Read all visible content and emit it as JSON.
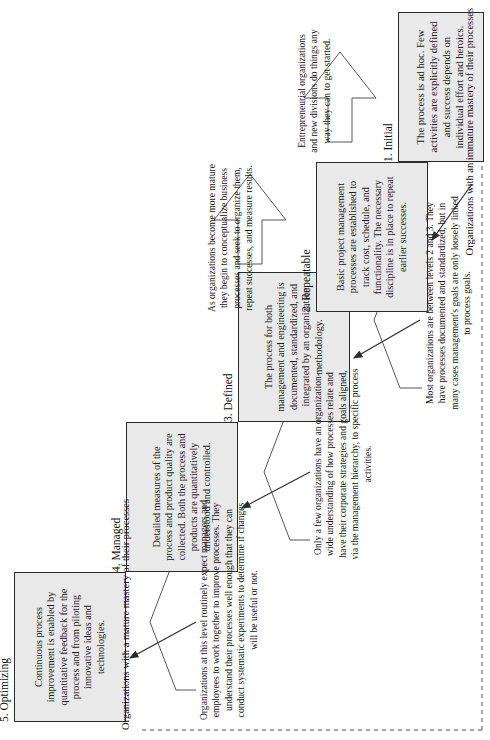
{
  "figure": {
    "type": "cmmi-maturity-staircase",
    "orientation": "rotated-90-ccw",
    "edge_labels": {
      "top": "Organizations with a mature mastery of their processes",
      "bottom": "Organizations with an immature mastery of their processes"
    },
    "colors": {
      "box_fill": "#e9e9e9",
      "box_border": "#2b2b2b",
      "text": "#111111",
      "arrow": "#2b2b2b"
    }
  },
  "levels": [
    {
      "id": "level5",
      "label": "5. Optimizing",
      "body": "Continuous process improvement is enabled by quantitative feedback for the process and from piloting innovative ideas and technologies."
    },
    {
      "id": "level4",
      "label": "4. Managed",
      "body": "Detailed measures of the process and product quality are collected. Both the process and products are quantitatively understood and controlled."
    },
    {
      "id": "level3",
      "label": "3. Defined",
      "body": "The process for both management and engineering is documented, standardized, and integrated by an organization methodology."
    },
    {
      "id": "level2",
      "label": "2. Repeatable",
      "body": "Basic project management processes are established to track cost, schedule, and functionality. The necessary discipline is in place to repeat earlier successes."
    },
    {
      "id": "level1",
      "label": "1. Initial",
      "body": "The process is ad hoc. Few activities are explicitly defined and success depends on individual effort and heroics."
    }
  ],
  "notes": [
    {
      "id": "note-level5",
      "text": "Organizations at this level routinely expect managers and employees to work together to improve processes. They understand their processes well enough that they can conduct systematic experiments to determine if changes will be useful or not."
    },
    {
      "id": "note-level4",
      "text": "Only a few organizations have an organization-wide understanding of how processes relate and have their corporate strategies and goals aligned, via the management hierarchy, to specific process activities."
    },
    {
      "id": "note-level3",
      "text": "Most organizations are between levels 2 and 3. They have processes documented and standardized, but in many cases management's goals are only loosely linked to process goals."
    },
    {
      "id": "note-level2",
      "text": "As organizations become more mature they begin to conceptualize business processes and seek to organize them, repeat successes, and measure results."
    },
    {
      "id": "note-level1",
      "text": "Entrepreneurial organizations and new divisions do things any way they can to get started."
    }
  ]
}
